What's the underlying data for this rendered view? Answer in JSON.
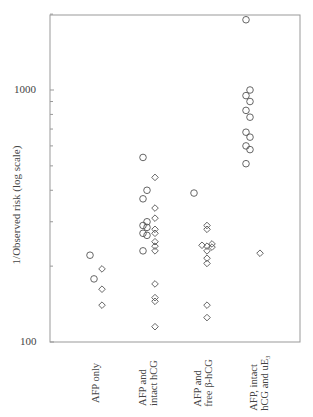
{
  "chart_data": {
    "type": "scatter",
    "title": "",
    "xlabel": "",
    "ylabel": "1/Observed risk (log scale)",
    "yscale": "log",
    "ylim": [
      100,
      2000
    ],
    "yticks_labeled": [
      100,
      1000
    ],
    "grid": false,
    "legend": null,
    "marker_legend_note": "circles and diamonds denote two marker types per group",
    "categories": [
      "AFP only",
      "AFP and intact hCG",
      "AFP and free β-hCG",
      "AFP, intact hCG and uE3"
    ],
    "category_label_lines": [
      [
        "AFP only"
      ],
      [
        "AFP and",
        "intact hCG"
      ],
      [
        "AFP and",
        "free β-hCG"
      ],
      [
        "AFP, intact",
        "hCG and uE₃"
      ]
    ],
    "series": [
      {
        "name": "circles",
        "marker": "circle",
        "points": [
          {
            "category": "AFP only",
            "values": [
              221,
              178
            ]
          },
          {
            "category": "AFP and intact hCG",
            "values": [
              540,
              400,
              370,
              300,
              290,
              285,
              270,
              265,
              230
            ]
          },
          {
            "category": "AFP and free β-hCG",
            "values": [
              390
            ]
          },
          {
            "category": "AFP, intact hCG and uE3",
            "values": [
              1900,
              1000,
              950,
              900,
              830,
              780,
              680,
              650,
              600,
              580,
              510
            ]
          }
        ]
      },
      {
        "name": "diamonds",
        "marker": "diamond",
        "points": [
          {
            "category": "AFP only",
            "values": [
              195,
              162,
              140
            ]
          },
          {
            "category": "AFP and intact hCG",
            "values": [
              450,
              340,
              310,
              280,
              270,
              250,
              240,
              230,
              170,
              150,
              145,
              115
            ]
          },
          {
            "category": "AFP and free β-hCG",
            "values": [
              290,
              280,
              245,
              242,
              240,
              238,
              230,
              215,
              205,
              140,
              125
            ]
          },
          {
            "category": "AFP, intact hCG and uE3",
            "values": [
              225
            ]
          }
        ]
      }
    ]
  },
  "axis": {
    "y_tick_1000": "1000",
    "y_tick_100": "100",
    "ylabel": "1/Observed risk (log scale)"
  },
  "categories": [
    {
      "label": "AFP only         "
    },
    {
      "line1": "AFP and",
      "line2": "intact hCG"
    },
    {
      "line1": "AFP and",
      "line2": "free β-hCG"
    },
    {
      "line1": "AFP, intact",
      "line2": "hCG and uE₃"
    }
  ]
}
